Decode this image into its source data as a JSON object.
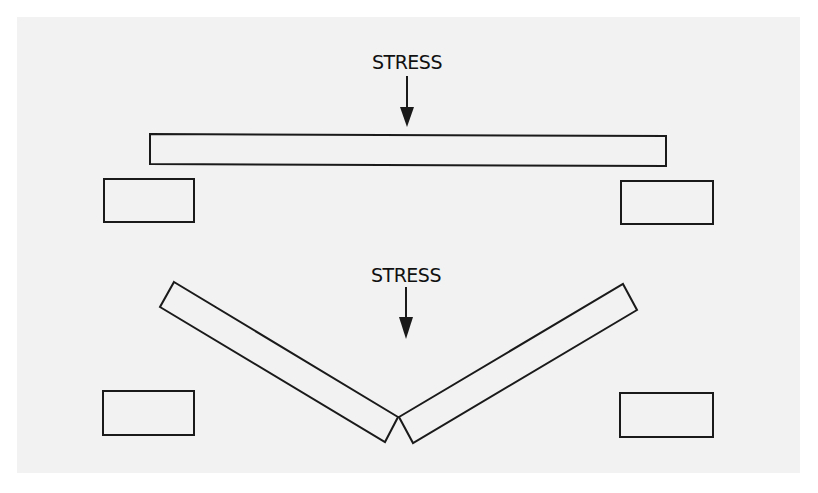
{
  "figure": {
    "background_color": "#f2f2f2",
    "stroke_color": "#1a1a1a",
    "panels": [
      {
        "name": "before",
        "stress_label": "STRESS",
        "description": "Intact beam resting on two supports with downward stress applied at center"
      },
      {
        "name": "after",
        "stress_label": "STRESS",
        "description": "Beam fractured at center into two pieces forming a V shape between supports"
      }
    ]
  }
}
